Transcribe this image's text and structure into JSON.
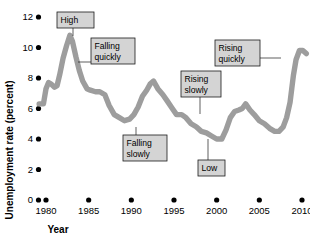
{
  "chart_data": {
    "type": "line",
    "title": "",
    "xlabel": "Year",
    "ylabel": "Unemployment rate (percent)",
    "xlim": [
      1979,
      2011
    ],
    "ylim": [
      0,
      12.6
    ],
    "grid": false,
    "legend": "none",
    "line_color": "#9d9d9d",
    "x_ticks": [
      1980,
      1985,
      1990,
      1995,
      2000,
      2005,
      2010
    ],
    "x_tick_labels": [
      "1980",
      "1985",
      "1990",
      "1995",
      "2000",
      "2005",
      "2010"
    ],
    "y_ticks": [
      0,
      2,
      4,
      6,
      8,
      10,
      12
    ],
    "y_tick_labels": [
      "0",
      "2",
      "4",
      "6",
      "8",
      "10",
      "12"
    ],
    "series": [
      {
        "name": "Unemployment rate",
        "x": [
          1979.2,
          1979.7,
          1980.0,
          1980.3,
          1980.6,
          1981.0,
          1981.3,
          1981.6,
          1982.0,
          1982.4,
          1982.8,
          1983.1,
          1983.5,
          1983.9,
          1984.3,
          1984.8,
          1985.2,
          1985.8,
          1986.3,
          1986.9,
          1987.4,
          1988.0,
          1988.6,
          1989.2,
          1989.8,
          1990.3,
          1990.8,
          1991.3,
          1991.8,
          1992.2,
          1992.6,
          1993.1,
          1993.7,
          1994.2,
          1994.8,
          1995.3,
          1995.9,
          1996.4,
          1997.0,
          1997.6,
          1998.2,
          1998.8,
          1999.4,
          2000.0,
          2000.6,
          2001.1,
          2001.6,
          2002.1,
          2002.6,
          2003.0,
          2003.4,
          2003.9,
          2004.4,
          2005.0,
          2005.6,
          2006.2,
          2006.8,
          2007.3,
          2007.8,
          2008.2,
          2008.6,
          2009.0,
          2009.3,
          2009.7,
          2010.1,
          2010.5
        ],
        "y": [
          6.3,
          6.3,
          7.3,
          7.7,
          7.6,
          7.4,
          7.5,
          8.2,
          9.3,
          10.1,
          10.8,
          10.4,
          9.4,
          8.5,
          7.8,
          7.3,
          7.2,
          7.1,
          7.1,
          6.9,
          6.2,
          5.6,
          5.4,
          5.2,
          5.3,
          5.6,
          6.1,
          6.8,
          7.2,
          7.6,
          7.8,
          7.3,
          6.9,
          6.5,
          6.0,
          5.6,
          5.6,
          5.4,
          5.0,
          4.8,
          4.5,
          4.4,
          4.2,
          4.0,
          4.0,
          4.6,
          5.4,
          5.8,
          5.9,
          6.0,
          6.3,
          5.9,
          5.6,
          5.2,
          5.0,
          4.7,
          4.5,
          4.5,
          4.8,
          5.4,
          6.4,
          8.2,
          9.2,
          9.8,
          9.8,
          9.6
        ]
      }
    ],
    "annotations": [
      {
        "id": "high",
        "label_line1": "High",
        "label_line2": "",
        "box_x": 57,
        "box_y": 12,
        "box_w": 37,
        "box_h": 16,
        "point_x": 73,
        "point_y": 36
      },
      {
        "id": "falling-quickly",
        "label_line1": "Falling",
        "label_line2": "quickly",
        "box_x": 91,
        "box_y": 38,
        "box_w": 44,
        "box_h": 26,
        "point_x": 78,
        "point_y": 62
      },
      {
        "id": "falling-slowly",
        "label_line1": "Falling",
        "label_line2": "slowly",
        "box_x": 123,
        "box_y": 135,
        "box_w": 44,
        "box_h": 26,
        "point_x": 136,
        "point_y": 127
      },
      {
        "id": "rising-slowly",
        "label_line1": "Rising",
        "label_line2": "slowly",
        "box_x": 181,
        "box_y": 71,
        "box_w": 40,
        "box_h": 26,
        "point_x": 200,
        "point_y": 114
      },
      {
        "id": "low",
        "label_line1": "Low",
        "label_line2": "",
        "box_x": 198,
        "box_y": 160,
        "box_w": 27,
        "box_h": 16,
        "point_x": 208,
        "point_y": 139
      },
      {
        "id": "rising-quickly",
        "label_line1": "Rising",
        "label_line2": "quickly",
        "box_x": 215,
        "box_y": 40,
        "box_w": 45,
        "box_h": 26,
        "point_x": 281,
        "point_y": 58
      }
    ]
  }
}
